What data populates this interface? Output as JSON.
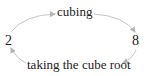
{
  "diagram": {
    "nodes": [
      {
        "id": "left",
        "label": "2"
      },
      {
        "id": "right",
        "label": "8"
      }
    ],
    "edges": [
      {
        "from": "left",
        "to": "right",
        "label": "cubing",
        "position": "top"
      },
      {
        "from": "right",
        "to": "left",
        "label": "taking the cube root",
        "position": "bottom"
      }
    ],
    "colors": {
      "text": "#222222",
      "arrow": "#bbbbbb",
      "background": "#ffffff"
    }
  }
}
